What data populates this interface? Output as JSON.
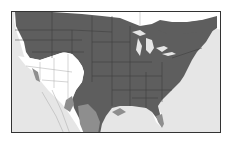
{
  "map": {
    "title": "",
    "region": "North America (contiguous US, southern Canada, northern Mexico)",
    "colors": {
      "background_water": "#e6e6e6",
      "land_outside_range": "#ffffff",
      "primary_range": "#5e5e5e",
      "secondary_range": "#8e8e8e",
      "boundaries": "#3a3a3a",
      "border_outside_range": "#a8a8a8",
      "frame": "#333333"
    },
    "legend": []
  }
}
